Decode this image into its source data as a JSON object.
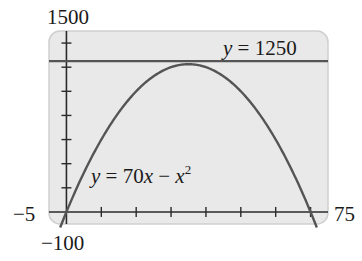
{
  "chart_data": {
    "type": "line",
    "title": "",
    "xlabel": "",
    "ylabel": "",
    "xlim": [
      -5,
      75
    ],
    "ylim": [
      -100,
      1500
    ],
    "xscale_ticks": 10,
    "yscale_ticks": 200,
    "grid": false,
    "legend": null,
    "window_labels": {
      "xmin": "−5",
      "xmax": "75",
      "ymin": "−100",
      "ymax": "1500"
    },
    "series": [
      {
        "name": "y = 70x − x²",
        "kind": "function",
        "expression": "70x - x^2",
        "x": [
          -2,
          0,
          5,
          10,
          15,
          20,
          25,
          30,
          35,
          40,
          45,
          50,
          55,
          60,
          65,
          70,
          72
        ],
        "values": [
          -144,
          0,
          325,
          600,
          825,
          1000,
          1125,
          1200,
          1225,
          1200,
          1125,
          1000,
          825,
          600,
          325,
          0,
          -144
        ],
        "color": "#555555"
      },
      {
        "name": "y = 1250",
        "kind": "horizontal-line",
        "value": 1250,
        "color": "#555555"
      }
    ],
    "annotations": [
      {
        "text_main": "y = 70x − x",
        "superscript": "2",
        "position": "left-middle, near curve"
      },
      {
        "text": "y = 1250",
        "position": "top-right, above line"
      }
    ]
  },
  "labels": {
    "ymax": "1500",
    "ymin": "−100",
    "xmin": "−5",
    "xmax": "75",
    "line_label": "y = 1250",
    "curve_label_main": "y = 70x − x",
    "curve_label_sup": "2"
  },
  "colors": {
    "screen_bg": "#e9e9e9",
    "screen_border": "#c9c9c9",
    "axis": "#2a2a2a",
    "curve": "#555555",
    "hline": "#555555"
  }
}
